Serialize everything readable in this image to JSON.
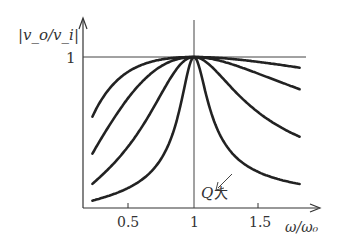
{
  "chart_data": {
    "type": "line",
    "title": "",
    "xlabel": "ω/ω₀",
    "ylabel": "|v_o/v_i|",
    "x_ticks": [
      0.5,
      1,
      1.5
    ],
    "x_tick_labels": [
      "0.5",
      "1",
      "1.5"
    ],
    "y_ticks": [
      1
    ],
    "y_tick_labels": [
      "1"
    ],
    "xlim": [
      0,
      2.0
    ],
    "ylim": [
      0,
      1.2
    ],
    "grid": false,
    "reference_line": {
      "y": 1,
      "label": "1"
    },
    "annotation": {
      "text": "Q大",
      "meaning": "arrow indicates direction of increasing Q (curves get narrower)"
    },
    "model": "|v_o/v_i| = 1 / sqrt(1 + Q^2 (x - 1/x)^2)",
    "x_range": [
      0.23,
      1.8
    ],
    "series": [
      {
        "name": "Q1 (lowest)",
        "Q": 0.32,
        "left_end_y": 0.61,
        "right_end_y": 0.57
      },
      {
        "name": "Q2",
        "Q": 0.63,
        "left_end_y": 0.36,
        "right_end_y": 0.32
      },
      {
        "name": "Q3",
        "Q": 1.5,
        "left_end_y": 0.16,
        "right_end_y": 0.13
      },
      {
        "name": "Q4 (highest)",
        "Q": 5.0,
        "left_end_y": 0.05,
        "right_end_y": 0.03
      }
    ]
  },
  "labels": {
    "y_axis": "|v_o/v_i|",
    "x_axis": "ω/ω₀",
    "y_one": "1",
    "x_05": "0.5",
    "x_1": "1",
    "x_15": "1.5",
    "annotation_q": "Q",
    "annotation_big": "大"
  }
}
